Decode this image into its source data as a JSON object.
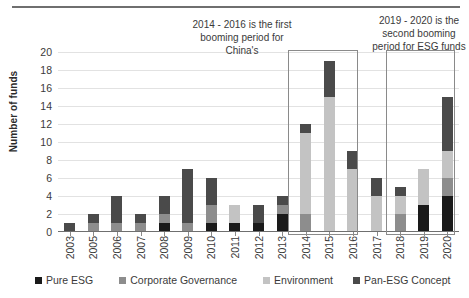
{
  "chart_data": {
    "type": "bar",
    "subtype": "stacked-bar",
    "title": "",
    "xlabel": "",
    "ylabel": "Number of funds",
    "ylim": [
      0,
      20
    ],
    "ytick_step": 2,
    "yticks": [
      20,
      18,
      16,
      14,
      12,
      10,
      8,
      6,
      4,
      2,
      0
    ],
    "grid": true,
    "legend_position": "bottom",
    "categories": [
      "2003",
      "2005",
      "2006",
      "2007",
      "2008",
      "2009",
      "2010",
      "2011",
      "2012",
      "2013",
      "2014",
      "2015",
      "2016",
      "2017",
      "2018",
      "2019",
      "2020"
    ],
    "series": [
      {
        "name": "Pure ESG",
        "color": "#1a1a1a",
        "values": [
          0,
          0,
          0,
          0,
          1,
          0,
          1,
          1,
          1,
          2,
          0,
          0,
          0,
          0,
          0,
          3,
          4
        ]
      },
      {
        "name": "Corporate Governance",
        "color": "#8d8d8d",
        "values": [
          0,
          1,
          1,
          1,
          1,
          1,
          2,
          0,
          0,
          1,
          2,
          0,
          0,
          0,
          2,
          0,
          2
        ]
      },
      {
        "name": "Environment",
        "color": "#c3c3c3",
        "values": [
          0,
          0,
          0,
          0,
          0,
          0,
          0,
          2,
          0,
          0,
          9,
          15,
          7,
          4,
          2,
          4,
          3
        ]
      },
      {
        "name": "Pan-ESG Concept",
        "color": "#4a4a4a",
        "values": [
          1,
          1,
          3,
          1,
          2,
          6,
          3,
          0,
          2,
          1,
          1,
          4,
          2,
          2,
          1,
          0,
          6
        ]
      }
    ],
    "totals": [
      1,
      2,
      4,
      2,
      4,
      7,
      6,
      3,
      3,
      4,
      12,
      19,
      9,
      6,
      5,
      7,
      15
    ],
    "annotations": [
      {
        "id": "first-booming",
        "text": "2014 - 2016 is the first booming period for China's",
        "highlights": [
          "2014",
          "2015",
          "2016"
        ]
      },
      {
        "id": "second-booming",
        "text": "2019 - 2020 is the second booming period for ESG funds",
        "highlights": [
          "2019",
          "2020"
        ]
      }
    ]
  },
  "legend": {
    "items": [
      {
        "label": "Pure ESG"
      },
      {
        "label": "Corporate Governance"
      },
      {
        "label": "Environment"
      },
      {
        "label": "Pan-ESG Concept"
      }
    ]
  }
}
